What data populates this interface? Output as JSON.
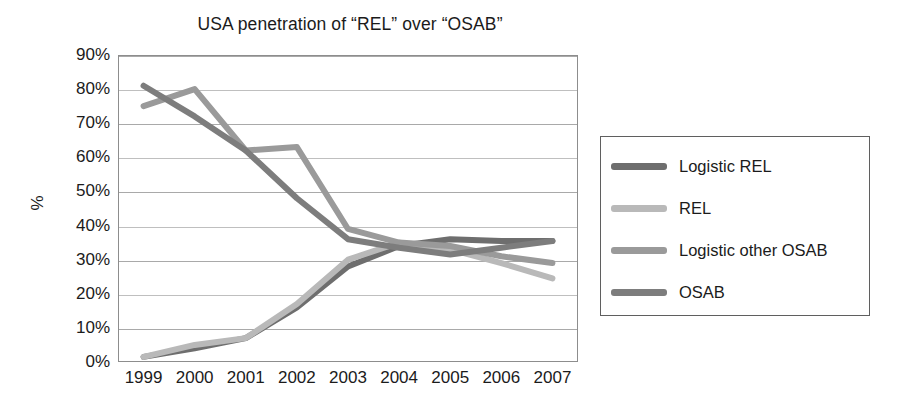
{
  "chart_data": {
    "type": "line",
    "title": "USA penetration of “REL” over “OSAB”",
    "xlabel": "",
    "ylabel": "%",
    "categories": [
      "1999",
      "2000",
      "2001",
      "2002",
      "2003",
      "2004",
      "2005",
      "2006",
      "2007"
    ],
    "x": [
      1999,
      2000,
      2001,
      2002,
      2003,
      2004,
      2005,
      2006,
      2007
    ],
    "ylim": [
      0,
      90
    ],
    "y_ticks": [
      "0%",
      "10%",
      "20%",
      "30%",
      "40%",
      "50%",
      "60%",
      "70%",
      "80%",
      "90%"
    ],
    "y_tick_values": [
      0,
      10,
      20,
      30,
      40,
      50,
      60,
      70,
      80,
      90
    ],
    "grid": true,
    "legend_position": "right",
    "series": [
      {
        "name": "Logistic REL",
        "color": "#6e6e6e",
        "values": [
          1.5,
          4,
          7,
          16,
          28,
          34,
          36,
          35.5,
          35.5
        ]
      },
      {
        "name": "REL",
        "color": "#b9b9b9",
        "values": [
          1.5,
          5,
          7,
          17,
          30,
          35,
          33,
          29,
          24.5
        ]
      },
      {
        "name": "Logistic other OSAB",
        "color": "#9a9a9a",
        "values": [
          75,
          80,
          62,
          63,
          39,
          35,
          34,
          31,
          29
        ]
      },
      {
        "name": "OSAB",
        "color": "#7d7d7d",
        "values": [
          81,
          72,
          62,
          48,
          36,
          33.5,
          31.5,
          33.5,
          35.5
        ]
      }
    ]
  },
  "legend": {
    "items": [
      {
        "label": "Logistic REL",
        "color": "#6e6e6e"
      },
      {
        "label": "REL",
        "color": "#b9b9b9"
      },
      {
        "label": "Logistic other OSAB",
        "color": "#9a9a9a"
      },
      {
        "label": "OSAB",
        "color": "#7d7d7d"
      }
    ]
  }
}
